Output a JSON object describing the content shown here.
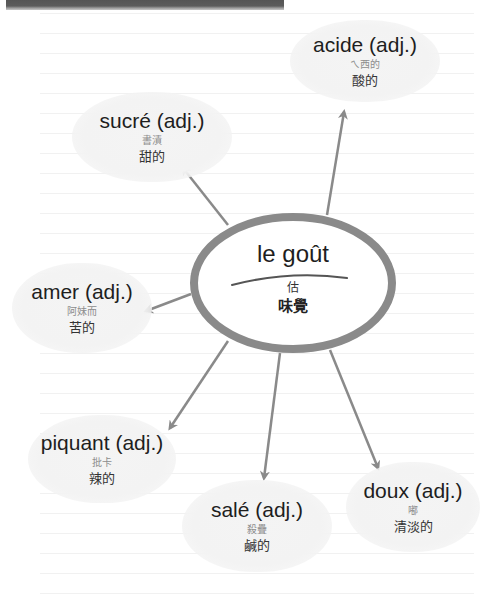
{
  "colors": {
    "ellipse_stroke": "#8a8a8a",
    "arrow": "#8a8a8a",
    "bubble_fill": "#f3f3f3",
    "header_bar": "#555555"
  },
  "center": {
    "word": "le goût",
    "phonetic": "估",
    "translation": "味覺"
  },
  "nodes": [
    {
      "id": "acide",
      "word": "acide (adj.)",
      "phonetic": "ㄟ西的",
      "translation": "酸的"
    },
    {
      "id": "sucre",
      "word": "sucré (adj.)",
      "phonetic": "書漬",
      "translation": "甜的"
    },
    {
      "id": "amer",
      "word": "amer (adj.)",
      "phonetic": "阿妹而",
      "translation": "苦的"
    },
    {
      "id": "piquant",
      "word": "piquant (adj.)",
      "phonetic": "批卡",
      "translation": "辣的"
    },
    {
      "id": "sale",
      "word": "salé (adj.)",
      "phonetic": "殺疊",
      "translation": "鹹的"
    },
    {
      "id": "doux",
      "word": "doux (adj.)",
      "phonetic": "嘟",
      "translation": "清淡的"
    }
  ]
}
